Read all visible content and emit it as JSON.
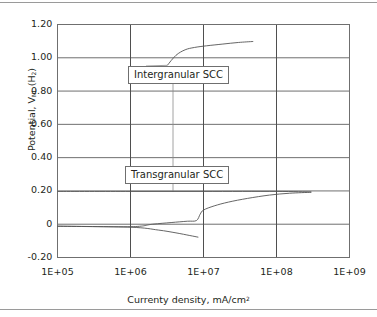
{
  "chart_data": {
    "type": "line",
    "title": "",
    "xlabel": "Currenty density, mA/cm",
    "xlabel_sup": "2",
    "ylabel_prefix": "Potential, V",
    "ylabel_sub": "NL",
    "ylabel_suffix": " (H",
    "ylabel_sub2": "2",
    "ylabel_end": ")",
    "xscale": "log",
    "xlim": [
      100000,
      1000000000
    ],
    "ylim": [
      -0.2,
      1.2
    ],
    "grid": true,
    "legend": "none",
    "xticks": [
      {
        "value": 100000,
        "label": "1E+05"
      },
      {
        "value": 1000000,
        "label": "1E+06"
      },
      {
        "value": 10000000,
        "label": "1E+07"
      },
      {
        "value": 100000000,
        "label": "1E+08"
      },
      {
        "value": 1000000000,
        "label": "1E+09"
      }
    ],
    "yticks": [
      {
        "value": 1.2,
        "label": "1.20"
      },
      {
        "value": 1.0,
        "label": "1.00"
      },
      {
        "value": 0.8,
        "label": "0.80"
      },
      {
        "value": 0.6,
        "label": "0.60"
      },
      {
        "value": 0.4,
        "label": "0.40"
      },
      {
        "value": 0.2,
        "label": "0.20"
      },
      {
        "value": 0.0,
        "label": "0"
      },
      {
        "value": -0.2,
        "label": "-0.20"
      }
    ],
    "series": [
      {
        "name": "Intergranular SCC branch",
        "points": [
          [
            3200000,
            0.955
          ],
          [
            4200000,
            1.015
          ],
          [
            5600000,
            1.048
          ],
          [
            7500000,
            1.062
          ],
          [
            11000000,
            1.072
          ],
          [
            18000000,
            1.082
          ],
          [
            30000000,
            1.092
          ],
          [
            48000000,
            1.098
          ]
        ]
      },
      {
        "name": "Transgranular SCC anodic branch",
        "points": [
          [
            100000,
            -0.012
          ],
          [
            1000000,
            -0.015
          ],
          [
            2000000,
            0.0
          ],
          [
            3600000,
            0.01
          ],
          [
            6000000,
            0.018
          ],
          [
            8000000,
            0.022
          ],
          [
            9000000,
            0.06
          ],
          [
            10000000,
            0.085
          ],
          [
            14000000,
            0.11
          ],
          [
            22000000,
            0.133
          ],
          [
            40000000,
            0.155
          ],
          [
            80000000,
            0.175
          ],
          [
            150000000,
            0.186
          ],
          [
            300000000,
            0.192
          ]
        ]
      },
      {
        "name": "Cathodic branch",
        "points": [
          [
            100000,
            -0.012
          ],
          [
            1000000,
            -0.018
          ],
          [
            2400000,
            -0.035
          ],
          [
            4200000,
            -0.052
          ],
          [
            6500000,
            -0.068
          ],
          [
            8500000,
            -0.078
          ]
        ]
      },
      {
        "name": "Upper plateau at 0.20",
        "points": [
          [
            100000,
            0.197
          ],
          [
            1000000,
            0.197
          ],
          [
            10000000,
            0.197
          ],
          [
            100000000,
            0.197
          ],
          [
            300000000,
            0.194
          ]
        ]
      }
    ],
    "annotations": [
      {
        "id": "intergranular",
        "text": "Intergranular SCC",
        "box_x_px": 128,
        "box_y_px": 66,
        "leader_to": [
          3200000,
          0.955
        ]
      },
      {
        "id": "transgranular",
        "text": "Transgranular SCC",
        "box_x_px": 125,
        "box_y_px": 166,
        "leader_to": [
          6300000,
          0.197
        ]
      }
    ]
  }
}
